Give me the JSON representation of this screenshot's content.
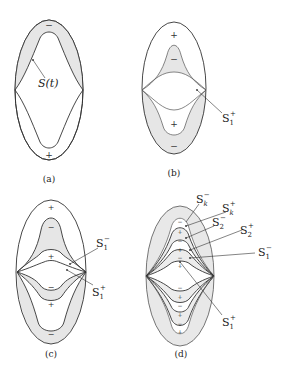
{
  "figure": {
    "panels": [
      {
        "id": "a",
        "caption": "(a)",
        "curve_label": "S(t)",
        "signs": {
          "top": "−",
          "bottom": "+"
        }
      },
      {
        "id": "b",
        "caption": "(b)",
        "curve_label": "S",
        "curve_label_sub": "1",
        "curve_label_sup": "+",
        "signs": {
          "outer_top": "+",
          "inner_top": "−",
          "inner_bottom": "+",
          "outer_bottom": "−"
        }
      },
      {
        "id": "c",
        "caption": "(c)",
        "labels": [
          {
            "base": "S",
            "sub": "1",
            "sup": "−"
          },
          {
            "base": "S",
            "sub": "1",
            "sup": "+"
          }
        ],
        "signs": [
          "+",
          "−",
          "+",
          "−",
          "+",
          "−"
        ]
      },
      {
        "id": "d",
        "caption": "(d)",
        "labels": [
          {
            "base": "S",
            "sub": "k",
            "sup": "−"
          },
          {
            "base": "S",
            "sub": "k",
            "sup": "+"
          },
          {
            "base": "S",
            "sub": "2",
            "sup": "−"
          },
          {
            "base": "S",
            "sub": "2",
            "sup": "+"
          },
          {
            "base": "S",
            "sub": "1",
            "sup": "−"
          },
          {
            "base": "S",
            "sub": "1",
            "sup": "+"
          }
        ]
      }
    ]
  }
}
